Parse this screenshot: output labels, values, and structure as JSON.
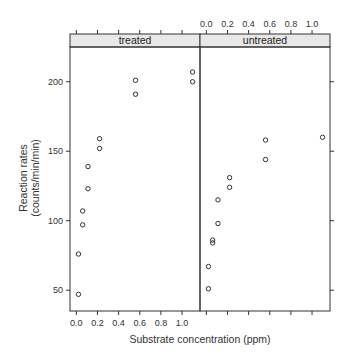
{
  "chart_data": {
    "type": "scatter",
    "title": "",
    "xlabel": "Substrate concentration (ppm)",
    "ylabel_lines": [
      "Reaction rates",
      "(counts/min/min)"
    ],
    "panels": [
      {
        "name": "treated",
        "x": [
          0.02,
          0.02,
          0.06,
          0.06,
          0.11,
          0.11,
          0.22,
          0.22,
          0.56,
          0.56,
          1.1,
          1.1
        ],
        "y": [
          76,
          47,
          97,
          107,
          123,
          139,
          159,
          152,
          191,
          201,
          207,
          200
        ]
      },
      {
        "name": "untreated",
        "x": [
          0.02,
          0.02,
          0.06,
          0.06,
          0.11,
          0.22,
          0.22,
          0.56,
          0.56,
          1.1
        ],
        "y": [
          67,
          51,
          84,
          86,
          98,
          115,
          131,
          124,
          144,
          158,
          160
        ]
      }
    ],
    "x_ticks": [
      0.0,
      0.2,
      0.4,
      0.6,
      0.8,
      1.0
    ],
    "x_tick_labels": [
      "0.0",
      "0.2",
      "0.4",
      "0.6",
      "0.8",
      "1.0"
    ],
    "y_ticks": [
      50,
      100,
      150,
      200
    ],
    "y_tick_labels": [
      "50",
      "100",
      "150",
      "200"
    ],
    "xlim": [
      -0.06,
      1.17
    ],
    "ylim": [
      35,
      225
    ],
    "grid": false,
    "legend": "none",
    "marker": "open-circle",
    "strip_color": "#e8e8e8",
    "axis_color": "#333333",
    "point_color": "#333333"
  }
}
